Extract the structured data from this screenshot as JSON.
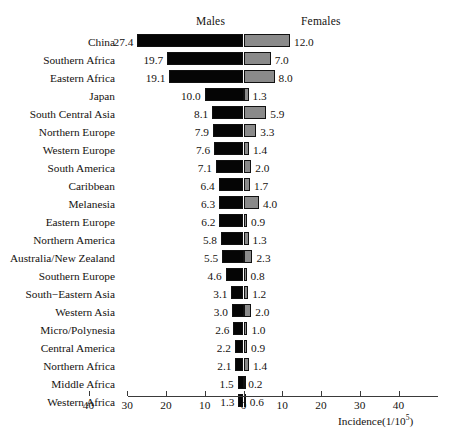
{
  "headers": {
    "males": "Males",
    "females": "Females"
  },
  "axis": {
    "title_text": "Incidence(1/10",
    "title_sup": "5",
    "title_close": ")",
    "ticks": [
      "40",
      "30",
      "20",
      "10",
      "0",
      "10",
      "20",
      "30",
      "40"
    ]
  },
  "colors": {
    "male_bar": "#050505",
    "female_bar": "#8a8a8a",
    "axis": "#3a3a3a",
    "text": "#15120f",
    "background": "#ffffff"
  },
  "chart_data": {
    "type": "bar",
    "orientation": "horizontal-diverging",
    "title": "",
    "subtitle": "",
    "xlabel": "Incidence(1/10^5)",
    "ylabel": "",
    "xlim": [
      -40,
      40
    ],
    "xticks": [
      -40,
      -30,
      -20,
      -10,
      0,
      10,
      20,
      30,
      40
    ],
    "xticklabels": [
      "40",
      "30",
      "20",
      "10",
      "0",
      "10",
      "20",
      "30",
      "40"
    ],
    "grid": false,
    "legend_position": "top",
    "categories": [
      "China",
      "Southern Africa",
      "Eastern Africa",
      "Japan",
      "South Central Asia",
      "Northern Europe",
      "Western Europe",
      "South America",
      "Caribbean",
      "Melanesia",
      "Eastern Europe",
      "Northern America",
      "Australia/New Zealand",
      "Southern Europe",
      "South−Eastern Asia",
      "Western Asia",
      "Micro/Polynesia",
      "Central America",
      "Northern Africa",
      "Middle Africa",
      "Western Africa"
    ],
    "series": [
      {
        "name": "Males",
        "direction": "left",
        "color": "#050505",
        "values": [
          27.4,
          19.7,
          19.1,
          10.0,
          8.1,
          7.9,
          7.6,
          7.1,
          6.4,
          6.3,
          6.2,
          5.8,
          5.5,
          4.6,
          3.1,
          3.0,
          2.6,
          2.2,
          2.1,
          1.5,
          1.3
        ]
      },
      {
        "name": "Females",
        "direction": "right",
        "color": "#8a8a8a",
        "values": [
          12.0,
          7.0,
          8.0,
          1.3,
          5.9,
          3.3,
          1.4,
          2.0,
          1.7,
          4.0,
          0.9,
          1.3,
          2.3,
          0.8,
          1.2,
          2.0,
          1.0,
          0.9,
          1.4,
          0.2,
          0.6
        ]
      }
    ]
  }
}
